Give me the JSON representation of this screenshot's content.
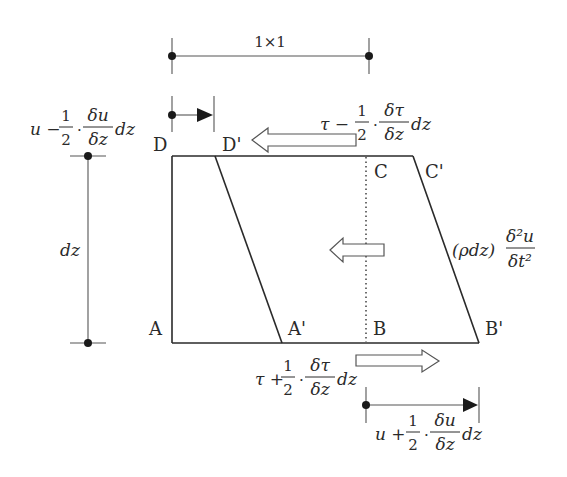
{
  "diagram": {
    "top_dimension_label": "1×1",
    "left_dimension_label": "dz",
    "corner_labels": {
      "D": "D",
      "D_prime": "D'",
      "C": "C",
      "C_prime": "C'",
      "A": "A",
      "A_prime": "A'",
      "B": "B",
      "B_prime": "B'"
    },
    "displacement_top": {
      "prefix": "u −",
      "coef_num": "1",
      "coef_den": "2",
      "dot": "·",
      "frac_num": "δu",
      "frac_den": "δz",
      "suffix": "dz"
    },
    "displacement_bottom": {
      "prefix": "u +",
      "coef_num": "1",
      "coef_den": "2",
      "dot": "·",
      "frac_num": "δu",
      "frac_den": "δz",
      "suffix": "dz"
    },
    "shear_top": {
      "prefix": "τ −",
      "coef_num": "1",
      "coef_den": "2",
      "dot": "·",
      "frac_num": "δτ",
      "frac_den": "δz",
      "suffix": "dz"
    },
    "shear_bottom": {
      "prefix": "τ +",
      "coef_num": "1",
      "coef_den": "2",
      "dot": "·",
      "frac_num": "δτ",
      "frac_den": "δz",
      "suffix": "dz"
    },
    "inertia_force": {
      "prefix": "(ρdz)",
      "frac_num": "δ²u",
      "frac_den": "δt²"
    }
  }
}
